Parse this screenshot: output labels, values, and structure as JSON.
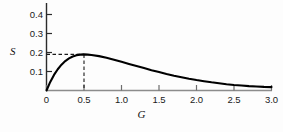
{
  "chart_data": {
    "type": "line",
    "title": "",
    "xlabel": "G",
    "ylabel": "S",
    "xlim": [
      0,
      3.0
    ],
    "ylim": [
      0,
      0.45
    ],
    "grid": false,
    "legend": null,
    "xticks": [
      "0",
      "0.5",
      "1.0",
      "1.5",
      "2.0",
      "2.5",
      "3.0"
    ],
    "xtick_values": [
      0,
      0.5,
      1.0,
      1.5,
      2.0,
      2.5,
      3.0
    ],
    "yticks": [
      "0.1",
      "0.2",
      "0.3",
      "0.4"
    ],
    "ytick_values": [
      0.1,
      0.2,
      0.3,
      0.4
    ],
    "series": [
      {
        "name": "S(G)",
        "color": "#000000",
        "x": [
          0.0,
          0.05,
          0.1,
          0.15,
          0.2,
          0.25,
          0.3,
          0.35,
          0.4,
          0.45,
          0.5,
          0.55,
          0.6,
          0.7,
          0.8,
          0.9,
          1.0,
          1.1,
          1.2,
          1.3,
          1.4,
          1.5,
          1.6,
          1.7,
          1.8,
          1.9,
          2.0,
          2.1,
          2.2,
          2.3,
          2.4,
          2.5,
          2.6,
          2.7,
          2.8,
          2.9,
          3.0
        ],
        "y": [
          0.0,
          0.045,
          0.082,
          0.112,
          0.136,
          0.155,
          0.169,
          0.179,
          0.186,
          0.189,
          0.19,
          0.189,
          0.187,
          0.181,
          0.172,
          0.162,
          0.151,
          0.14,
          0.129,
          0.118,
          0.107,
          0.097,
          0.087,
          0.078,
          0.07,
          0.062,
          0.055,
          0.049,
          0.043,
          0.038,
          0.033,
          0.029,
          0.026,
          0.023,
          0.021,
          0.019,
          0.018
        ]
      }
    ],
    "annotations": [
      {
        "name": "peak-guide",
        "type": "dashed-guides",
        "x": 0.5,
        "y": 0.19,
        "style": "dashed",
        "color": "#1a1a1a"
      }
    ]
  },
  "labels": {
    "y_axis_title": "S",
    "x_axis_title": "G"
  }
}
